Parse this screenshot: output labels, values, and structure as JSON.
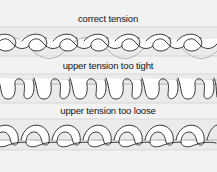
{
  "figure": {
    "background_color": "#f2f2f2",
    "band_color": "#ebebeb",
    "thread_stroke_color": "#1a1a1a",
    "thread_fill_color": "#ffffff",
    "width": 217,
    "height": 172
  },
  "sections": [
    {
      "id": "correct-tension",
      "label": "correct tension",
      "label_x": 108,
      "label_y": 22,
      "band_top": 27,
      "band_height": 29,
      "pattern": "interlocking-loops",
      "repeats": 7,
      "repeat_width": 31
    },
    {
      "id": "upper-tension-too-tight",
      "label": "upper tension too tight",
      "label_x": 108,
      "label_y": 69,
      "band_top": 74,
      "band_height": 29,
      "pattern": "u-loops-below-line",
      "repeats": 6,
      "repeat_width": 36
    },
    {
      "id": "upper-tension-too-loose",
      "label": "upper tension too loose",
      "label_x": 108,
      "label_y": 114,
      "band_top": 119,
      "band_height": 31,
      "pattern": "arches-above-line",
      "repeats": 7,
      "repeat_width": 31
    }
  ]
}
